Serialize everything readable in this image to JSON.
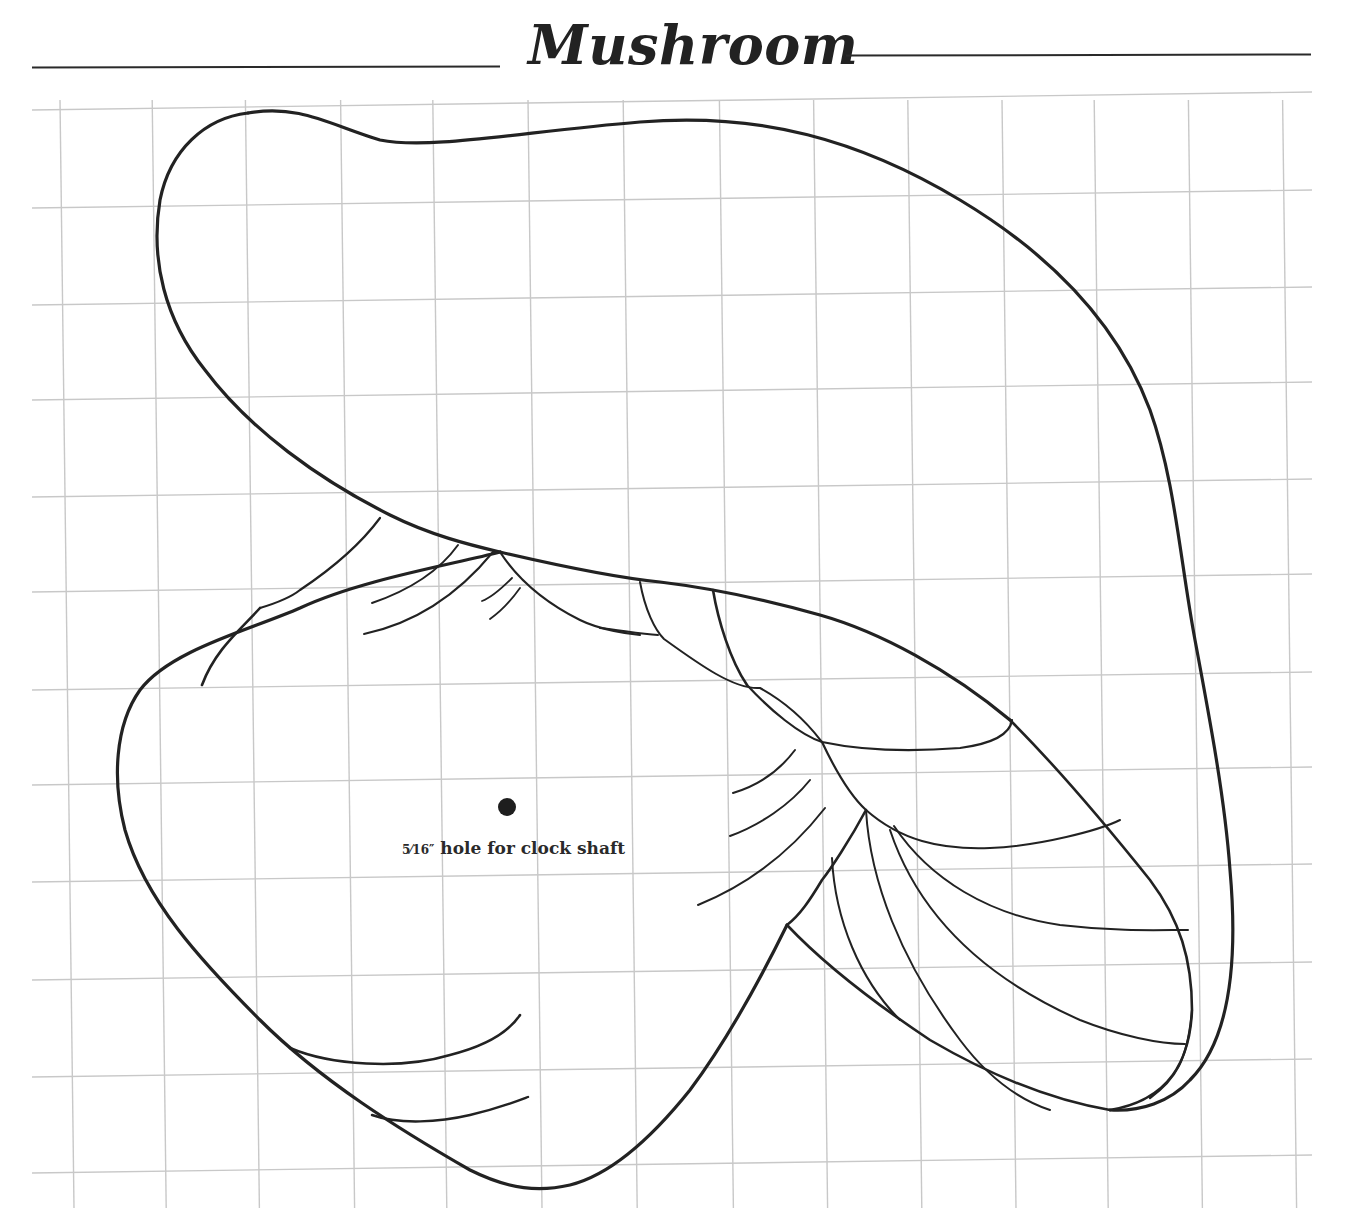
{
  "title": "Mushroom",
  "annotation": {
    "fraction": "5⁄16″",
    "text": " hole for clock shaft"
  },
  "grid": {
    "color": "#c8c8c8",
    "columns": [
      60,
      152,
      245,
      340,
      432,
      527,
      622,
      718,
      812,
      906,
      1000,
      1092,
      1186,
      1280
    ],
    "rows": [
      110,
      208,
      305,
      400,
      497,
      592,
      690,
      785,
      882,
      980,
      1077,
      1173
    ]
  },
  "colors": {
    "ink": "#222222",
    "paper": "#ffffff"
  },
  "hole": {
    "cx": 507,
    "cy": 807,
    "r": 9
  }
}
